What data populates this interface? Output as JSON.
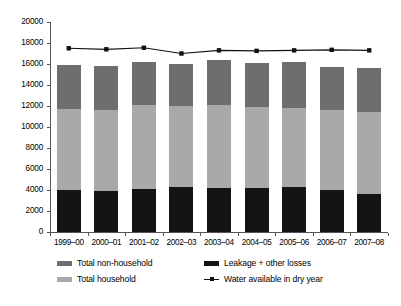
{
  "chart_data": {
    "type": "bar",
    "title": "",
    "subtitle": "",
    "xlabel": "",
    "ylabel": "",
    "ylim": [
      0,
      20000
    ],
    "ytick_interval": 2000,
    "grid": false,
    "stacked": true,
    "legend_position": "bottom",
    "categories": [
      "1999–00",
      "2000–01",
      "2001–02",
      "2002–03",
      "2003–04",
      "2004–05",
      "2005–06",
      "2006–07",
      "2007–08"
    ],
    "ytick_labels": [
      "0",
      "2000",
      "4000",
      "6000",
      "8000",
      "10000",
      "12000",
      "14000",
      "16000",
      "18000",
      "20000"
    ],
    "ytick_values": [
      0,
      2000,
      4000,
      6000,
      8000,
      10000,
      12000,
      14000,
      16000,
      18000,
      20000
    ],
    "series": [
      {
        "name": "Leakage + other losses",
        "kind": "bar",
        "color": "#141414",
        "stack_order": 1,
        "values": [
          4000,
          3950,
          4100,
          4250,
          4200,
          4150,
          4250,
          4000,
          3600
        ]
      },
      {
        "name": "Total household",
        "kind": "bar",
        "color": "#a9a9a9",
        "stack_order": 2,
        "values": [
          7750,
          7700,
          7950,
          7750,
          7900,
          7750,
          7600,
          7650,
          7800
        ]
      },
      {
        "name": "Total non-household",
        "kind": "bar",
        "color": "#6e6e6e",
        "stack_order": 3,
        "values": [
          4150,
          4150,
          4100,
          4000,
          4250,
          4200,
          4350,
          4100,
          4200
        ]
      },
      {
        "name": "Water available in dry year",
        "kind": "line",
        "color": "#111111",
        "marker": "square",
        "values": [
          17500,
          17400,
          17550,
          17000,
          17300,
          17250,
          17300,
          17350,
          17300
        ]
      }
    ],
    "bar_totals": [
      15900,
      15800,
      16150,
      16000,
      16350,
      16100,
      16200,
      15750,
      15600
    ]
  },
  "legend": {
    "items": [
      {
        "label": "Total non-household",
        "swatch": "dark-gray-swatch",
        "kind": "bar"
      },
      {
        "label": "Total household",
        "swatch": "light-gray-swatch",
        "kind": "bar"
      },
      {
        "label": "Leakage + other losses",
        "swatch": "black-swatch",
        "kind": "bar"
      },
      {
        "label": "Water available in dry year",
        "swatch": "line-marker-swatch",
        "kind": "line"
      }
    ]
  },
  "colors": {
    "non_household": "#6e6e6e",
    "household": "#a9a9a9",
    "leakage": "#141414",
    "line": "#111111",
    "axis": "#555555",
    "background": "#ffffff"
  }
}
